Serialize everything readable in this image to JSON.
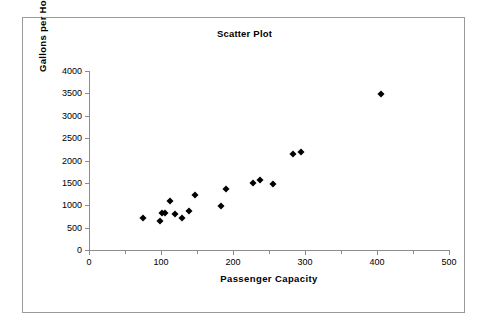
{
  "chart_data": {
    "type": "scatter",
    "title": "Scatter Plot",
    "xlabel": "Passenger Capacity",
    "ylabel": "Gallons per Hour",
    "xlim": [
      0,
      500
    ],
    "ylim": [
      0,
      4000
    ],
    "xticks": [
      0,
      100,
      200,
      300,
      400,
      500
    ],
    "xtick_labels": [
      "0",
      "100",
      "200",
      "300",
      "400",
      "500"
    ],
    "xminor_ticks": [
      50,
      150,
      250,
      350,
      450
    ],
    "yticks": [
      0,
      500,
      1000,
      1500,
      2000,
      2500,
      3000,
      3500,
      4000
    ],
    "ytick_labels": [
      "0",
      "500",
      "1000",
      "1500",
      "2000",
      "2500",
      "3000",
      "3500",
      "4000"
    ],
    "grid": false,
    "legend": false,
    "marker": "filled-diamond",
    "marker_color": "#000000",
    "series": [
      {
        "name": "Aircraft",
        "points": [
          {
            "x": 75,
            "y": 720
          },
          {
            "x": 99,
            "y": 640
          },
          {
            "x": 101,
            "y": 830
          },
          {
            "x": 106,
            "y": 820
          },
          {
            "x": 112,
            "y": 1100
          },
          {
            "x": 120,
            "y": 800
          },
          {
            "x": 129,
            "y": 720
          },
          {
            "x": 139,
            "y": 870
          },
          {
            "x": 147,
            "y": 1230
          },
          {
            "x": 184,
            "y": 990
          },
          {
            "x": 190,
            "y": 1360
          },
          {
            "x": 228,
            "y": 1490
          },
          {
            "x": 238,
            "y": 1570
          },
          {
            "x": 255,
            "y": 1470
          },
          {
            "x": 284,
            "y": 2140
          },
          {
            "x": 295,
            "y": 2180
          },
          {
            "x": 405,
            "y": 3480
          }
        ]
      }
    ]
  },
  "frame": {
    "border_color": "#9a9a9a",
    "background": "#ffffff"
  }
}
